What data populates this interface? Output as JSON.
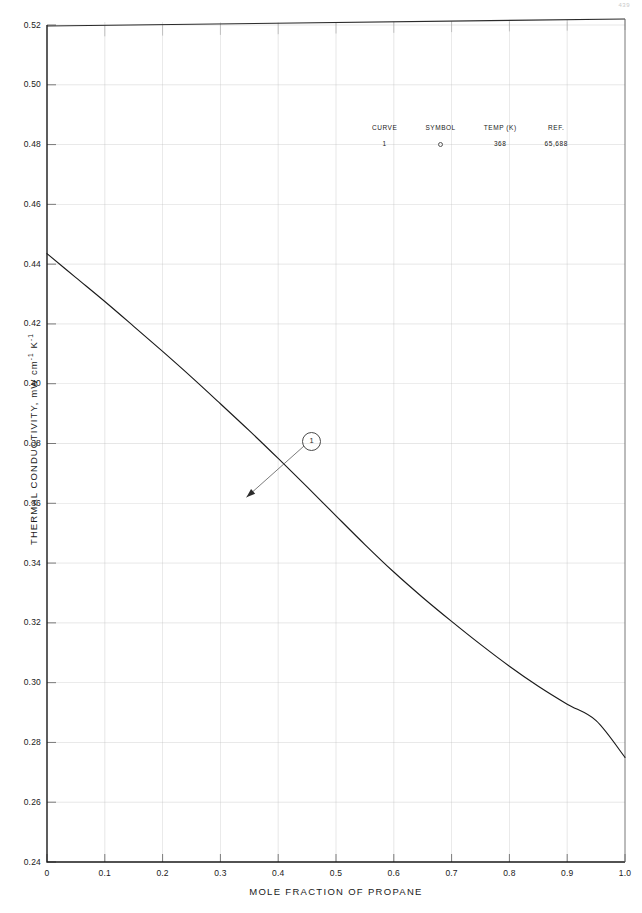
{
  "page_number": "439",
  "chart_data": {
    "type": "line",
    "title": "",
    "xlabel": "MOLE FRACTION OF PROPANE",
    "ylabel": "THERMAL CONDUCTIVITY, mW cm",
    "ylabel_sup1": "-1",
    "ylabel_mid": " K",
    "ylabel_sup2": "-1",
    "xlim": [
      0,
      1.0
    ],
    "ylim": [
      0.24,
      0.52
    ],
    "xticks": [
      "0",
      "0.1",
      "0.2",
      "0.3",
      "0.4",
      "0.5",
      "0.6",
      "0.7",
      "0.8",
      "0.9",
      "1.0"
    ],
    "xtick_values": [
      0,
      0.1,
      0.2,
      0.3,
      0.4,
      0.5,
      0.6,
      0.7,
      0.8,
      0.9,
      1.0
    ],
    "yticks": [
      "0.24",
      "0.26",
      "0.28",
      "0.30",
      "0.32",
      "0.34",
      "0.36",
      "0.38",
      "0.40",
      "0.42",
      "0.44",
      "0.46",
      "0.48",
      "0.50",
      "0.52"
    ],
    "ytick_values": [
      0.24,
      0.26,
      0.28,
      0.3,
      0.32,
      0.34,
      0.36,
      0.38,
      0.4,
      0.42,
      0.44,
      0.46,
      0.48,
      0.5,
      0.52
    ],
    "grid": true,
    "grid_color": "#b9b9b9",
    "legend_position": "upper-right-inset",
    "series": [
      {
        "name": "1",
        "curve_label": "1",
        "symbol": "open-circle",
        "temp_k": "368",
        "ref": "65,688",
        "color": "#1a1a1a",
        "x": [
          0.0,
          0.05,
          0.1,
          0.15,
          0.2,
          0.25,
          0.3,
          0.35,
          0.4,
          0.45,
          0.5,
          0.55,
          0.6,
          0.65,
          0.7,
          0.75,
          0.8,
          0.85,
          0.9,
          0.95,
          1.0
        ],
        "y": [
          0.4435,
          0.4355,
          0.4275,
          0.4192,
          0.4108,
          0.4022,
          0.3933,
          0.3843,
          0.375,
          0.3655,
          0.3558,
          0.3462,
          0.337,
          0.3285,
          0.3205,
          0.3128,
          0.3055,
          0.2988,
          0.2928,
          0.2873,
          0.275
        ]
      }
    ],
    "annotations": [
      {
        "label": "1",
        "type": "circled-callout",
        "points_to_x": 0.345,
        "points_to_y": 0.362
      }
    ]
  },
  "legend": {
    "headers": [
      "CURVE",
      "SYMBOL",
      "TEMP (K)",
      "REF."
    ],
    "rows": [
      {
        "curve": "1",
        "symbol": "",
        "temp": "368",
        "ref": "65,688"
      }
    ]
  }
}
